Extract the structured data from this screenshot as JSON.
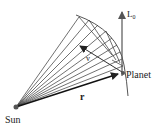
{
  "diagram": {
    "labels": {
      "sun": "Sun",
      "planet": "Planet",
      "r": "r",
      "v": "v",
      "L": "L",
      "L_sub": "0"
    },
    "colors": {
      "line": "#333333",
      "arrow_L": "#555555",
      "text": "#222222"
    }
  }
}
